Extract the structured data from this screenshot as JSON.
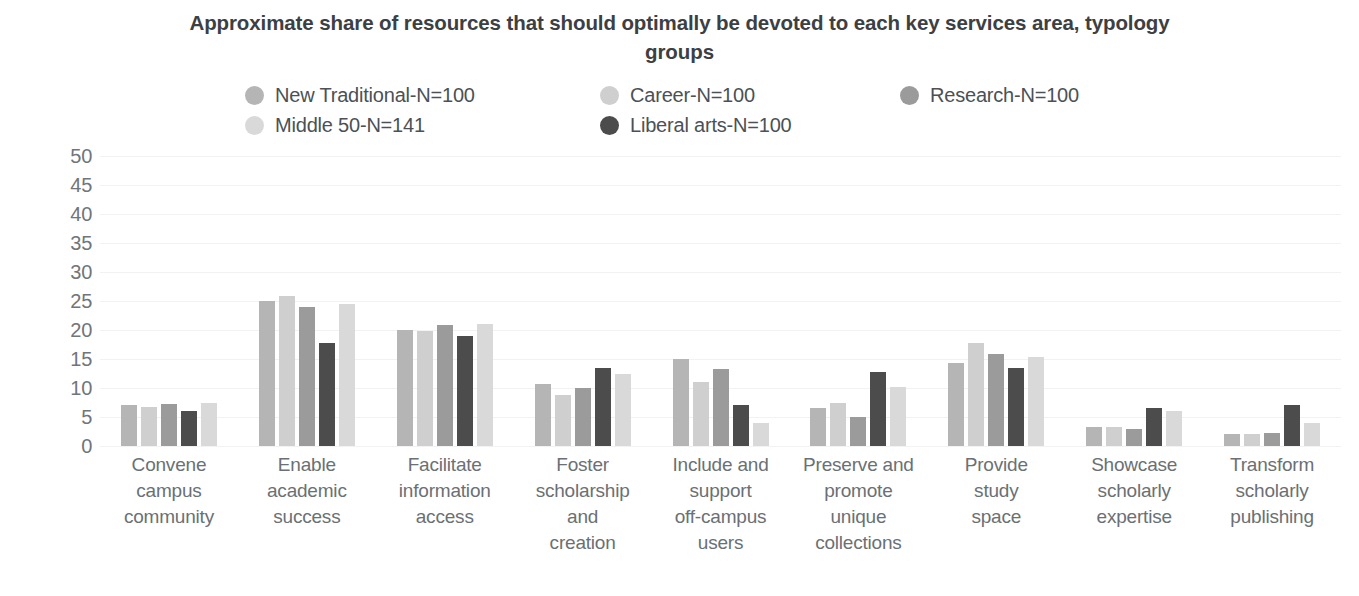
{
  "chart_data": {
    "type": "bar",
    "title": "Approximate share of resources that should optimally be devoted to each key services area, typology groups",
    "xlabel": "",
    "ylabel": "",
    "ylim": [
      0,
      50
    ],
    "yticks": [
      50,
      45,
      40,
      35,
      30,
      25,
      20,
      15,
      10,
      5,
      0
    ],
    "grid": true,
    "legend_position": "top",
    "categories": [
      "Convene campus community",
      "Enable academic success",
      "Facilitate information access",
      "Foster scholarship and creation",
      "Include and support off-campus users",
      "Preserve and promote unique collections",
      "Provide study space",
      "Showcase scholarly expertise",
      "Transform scholarly publishing"
    ],
    "category_lines": [
      [
        "Convene",
        "campus",
        "community"
      ],
      [
        "Enable",
        "academic",
        "success"
      ],
      [
        "Facilitate",
        "information",
        "access"
      ],
      [
        "Foster",
        "scholarship",
        "and",
        "creation"
      ],
      [
        "Include and",
        "support",
        "off-campus",
        "users"
      ],
      [
        "Preserve and",
        "promote",
        "unique",
        "collections"
      ],
      [
        "Provide",
        "study",
        "space"
      ],
      [
        "Showcase",
        "scholarly",
        "expertise"
      ],
      [
        "Transform",
        "scholarly",
        "publishing"
      ]
    ],
    "series": [
      {
        "name": "New Traditional-N=100",
        "color": "#b5b5b5",
        "values": [
          7.0,
          25.0,
          20.0,
          10.7,
          15.0,
          6.5,
          14.3,
          3.2,
          2.0
        ]
      },
      {
        "name": "Career-N=100",
        "color": "#cfcfcf",
        "values": [
          6.8,
          25.8,
          19.8,
          8.8,
          11.0,
          7.5,
          17.8,
          3.2,
          2.0
        ]
      },
      {
        "name": "Research-N=100",
        "color": "#9b9b9b",
        "values": [
          7.3,
          24.0,
          20.8,
          10.0,
          13.2,
          5.0,
          15.8,
          3.0,
          2.2
        ]
      },
      {
        "name": "Middle 50-N=141",
        "color": "#d9d9d9",
        "values": [
          7.5,
          24.5,
          21.0,
          12.5,
          4.0,
          10.2,
          15.3,
          6.0,
          4.0
        ]
      },
      {
        "name": "Liberal arts-N=100",
        "color": "#4c4c4c",
        "values": [
          6.0,
          17.7,
          19.0,
          13.5,
          7.0,
          12.7,
          13.5,
          6.5,
          7.0
        ]
      }
    ],
    "bar_order": [
      "New Traditional-N=100",
      "Career-N=100",
      "Research-N=100",
      "Liberal arts-N=100",
      "Middle 50-N=141"
    ]
  },
  "legend": {
    "items": [
      {
        "label": "New Traditional-N=100",
        "color": "#b5b5b5",
        "column": 1
      },
      {
        "label": "Career-N=100",
        "color": "#cfcfcf",
        "column": 2
      },
      {
        "label": "Research-N=100",
        "color": "#9b9b9b",
        "column": 3
      },
      {
        "label": "Middle 50-N=141",
        "color": "#d9d9d9",
        "column": 1
      },
      {
        "label": "Liberal arts-N=100",
        "color": "#4c4c4c",
        "column": 2
      }
    ]
  },
  "colors": {
    "title": "#3c4043",
    "axis_text": "#70757a",
    "gridline": "#f2f2f2",
    "background": "#ffffff"
  }
}
